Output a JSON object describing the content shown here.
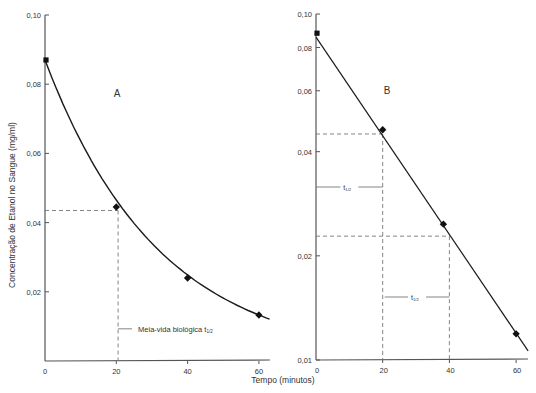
{
  "chart_data": [
    {
      "id": "A",
      "type": "line",
      "panel_label": "A",
      "title": "",
      "xlabel": "Tempo (minutos)",
      "ylabel": "Concentração de Etanol no Sangue (mg/ml)",
      "y_scale": "linear",
      "xlim": [
        0,
        63
      ],
      "ylim": [
        0,
        0.1
      ],
      "x_ticks": [
        0,
        20,
        40,
        60
      ],
      "x_tick_labels": [
        "0",
        "20",
        "40",
        "60"
      ],
      "y_ticks": [
        0.02,
        0.04,
        0.06,
        0.08,
        0.1
      ],
      "y_tick_labels": [
        "0,02",
        "0,04",
        "0,06",
        "0,08",
        "0,10"
      ],
      "grid": false,
      "series": [
        {
          "name": "Etanol no sangue",
          "x": [
            0,
            20,
            40,
            60
          ],
          "values": [
            0.087,
            0.0445,
            0.024,
            0.0133
          ],
          "fit": "exponential decay curve"
        }
      ],
      "annotations": [
        {
          "type": "dashed-guide",
          "x": 20.5,
          "y": 0.0435
        },
        {
          "type": "label",
          "text": "Meia-vida biológica t",
          "subscript": "1/2",
          "x": 20.5,
          "y": 0.0093
        }
      ]
    },
    {
      "id": "B",
      "type": "line",
      "panel_label": "B",
      "title": "",
      "xlabel": "Tempo (minutos)",
      "ylabel": "",
      "y_scale": "log",
      "xlim": [
        0,
        63
      ],
      "ylim": [
        0.01,
        0.1
      ],
      "x_ticks": [
        0,
        20,
        40,
        60
      ],
      "x_tick_labels": [
        "0",
        "20",
        "40",
        "60"
      ],
      "y_ticks": [
        0.01,
        0.02,
        0.04,
        0.06,
        0.08,
        0.1
      ],
      "y_tick_labels": [
        "0,01",
        "0,02",
        "0,04",
        "0,06",
        "0,08",
        "0,10"
      ],
      "grid": false,
      "series": [
        {
          "name": "Etanol no sangue (log)",
          "x": [
            0,
            20,
            40,
            60
          ],
          "values": [
            0.088,
            0.0463,
            0.0247,
            0.0119
          ],
          "fit": "straight line on log scale"
        }
      ],
      "annotations": [
        {
          "type": "dashed-guide",
          "x": 20,
          "y": 0.045
        },
        {
          "type": "dashed-guide",
          "x": 40,
          "y": 0.0228
        },
        {
          "type": "bracket",
          "text": "t",
          "subscript": "1/2",
          "x_from": 0,
          "x_to": 20
        },
        {
          "type": "bracket",
          "text": "t",
          "subscript": "1/2",
          "x_from": 20,
          "x_to": 40
        }
      ]
    }
  ],
  "labels": {
    "panel_a": "A",
    "panel_b": "B",
    "ylabel": "Concentração de Etanol no Sangue (mg/ml)",
    "xlabel": "Tempo (minutos)",
    "half_life_text": "Meia-vida biológica t",
    "half_life_sub": "1/2",
    "t_text": "t",
    "t_sub": "1/2"
  },
  "colors": {
    "axis": "#555555",
    "line": "#1a1a1a",
    "dashed": "#777777",
    "marker": "#111111"
  }
}
